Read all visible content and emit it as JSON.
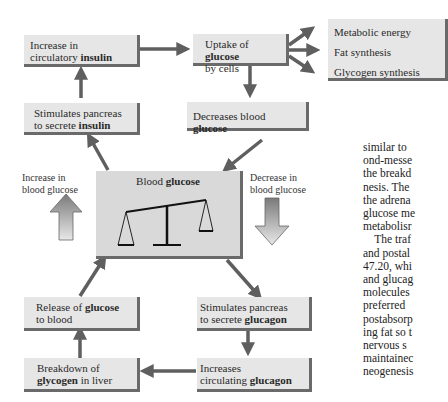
{
  "diagram": {
    "boxes": {
      "insulin_increase": {
        "pre": "Increase in",
        "line2": "circulatory ",
        "bold": "insulin"
      },
      "uptake": {
        "pre": "Uptake of ",
        "bold": "glucose",
        "line2": "by cells"
      },
      "outcomes": [
        "Metabolic energy",
        "Fat synthesis",
        "Glycogen synthesis"
      ],
      "stim_insulin": {
        "line1": "Stimulates pancreas",
        "pre2": "to secrete ",
        "bold": "insulin"
      },
      "decrease_glucose": {
        "pre": "Decreases blood ",
        "bold": "glucose"
      },
      "blood_glucose": {
        "pre": "Blood ",
        "bold": "glucose"
      },
      "release": {
        "pre": "Release of ",
        "bold": "glucose",
        "line2": "to blood"
      },
      "stim_glucagon": {
        "line1": "Stimulates pancreas",
        "pre2": "to secrete ",
        "bold": "glucagon"
      },
      "breakdown": {
        "line1": "Breakdown of",
        "bold": "glycogen",
        "post2": " in liver"
      },
      "increase_glucagon": {
        "line1": "Increases",
        "pre2": "circulating ",
        "bold": "glucagon"
      }
    },
    "labels": {
      "increase_line1": "Increase in",
      "increase_line2": "blood glucose",
      "decrease_line1": "Decrease in",
      "decrease_line2": "blood glucose"
    },
    "colors": {
      "box_fill": "#e6e6e6",
      "box_shadow": "#6a6a6a",
      "arrow": "#666666",
      "center_fill": "#d9d9d9"
    }
  },
  "body_text": [
    "similar to",
    "ond-messe",
    "the breakd",
    "nesis. The",
    "the adrena",
    "glucose me",
    "metabolisr",
    "    The traf",
    "and postal",
    "47.20, whi",
    "and glucag",
    "molecules",
    "preferred",
    "postabsorp",
    "ing fat so t",
    "nervous s",
    "maintainec",
    "neogenesis"
  ]
}
